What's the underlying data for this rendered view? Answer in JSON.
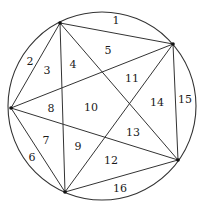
{
  "diagram": {
    "circle": {
      "cx": 102,
      "cy": 106,
      "r": 94,
      "stroke": "#333333"
    },
    "points": [
      {
        "id": "A",
        "x": 60,
        "y": 23
      },
      {
        "id": "B",
        "x": 173,
        "y": 44
      },
      {
        "id": "C",
        "x": 11,
        "y": 108
      },
      {
        "id": "D",
        "x": 65,
        "y": 192
      },
      {
        "id": "E",
        "x": 178,
        "y": 160
      }
    ],
    "chords": [
      [
        "A",
        "B"
      ],
      [
        "A",
        "C"
      ],
      [
        "A",
        "D"
      ],
      [
        "A",
        "E"
      ],
      [
        "B",
        "C"
      ],
      [
        "B",
        "D"
      ],
      [
        "B",
        "E"
      ],
      [
        "C",
        "D"
      ],
      [
        "C",
        "E"
      ],
      [
        "D",
        "E"
      ]
    ],
    "regions": [
      {
        "label": "1",
        "x": 116,
        "y": 24
      },
      {
        "label": "2",
        "x": 30,
        "y": 65
      },
      {
        "label": "3",
        "x": 47,
        "y": 74
      },
      {
        "label": "4",
        "x": 73,
        "y": 68
      },
      {
        "label": "5",
        "x": 108,
        "y": 54
      },
      {
        "label": "6",
        "x": 32,
        "y": 161
      },
      {
        "label": "7",
        "x": 46,
        "y": 144
      },
      {
        "label": "8",
        "x": 51,
        "y": 112
      },
      {
        "label": "9",
        "x": 78,
        "y": 150
      },
      {
        "label": "10",
        "x": 91,
        "y": 111
      },
      {
        "label": "11",
        "x": 132,
        "y": 82
      },
      {
        "label": "12",
        "x": 111,
        "y": 164
      },
      {
        "label": "13",
        "x": 133,
        "y": 136
      },
      {
        "label": "14",
        "x": 157,
        "y": 106
      },
      {
        "label": "15",
        "x": 185,
        "y": 103
      },
      {
        "label": "16",
        "x": 120,
        "y": 192
      }
    ]
  }
}
